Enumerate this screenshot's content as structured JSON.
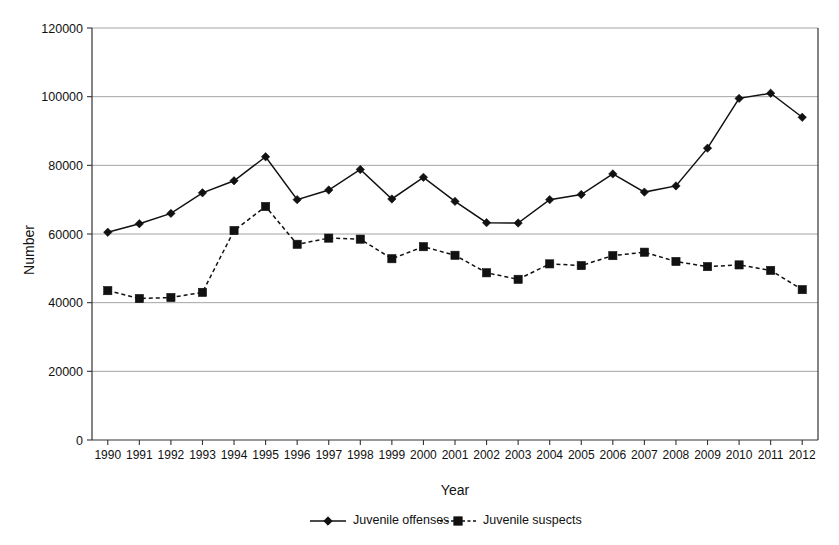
{
  "chart_data": {
    "type": "line",
    "title": "",
    "xlabel": "Year",
    "ylabel": "Number",
    "ylim": [
      0,
      120000
    ],
    "ytick_labels": [
      "0",
      "20000",
      "40000",
      "60000",
      "80000",
      "100000",
      "120000"
    ],
    "yticks": [
      0,
      20000,
      40000,
      60000,
      80000,
      100000,
      120000
    ],
    "grid": "horizontal",
    "legend_position": "bottom",
    "categories": [
      "1990",
      "1991",
      "1992",
      "1993",
      "1994",
      "1995",
      "1996",
      "1997",
      "1998",
      "1999",
      "2000",
      "2001",
      "2002",
      "2003",
      "2004",
      "2005",
      "2006",
      "2007",
      "2008",
      "2009",
      "2010",
      "2011",
      "2012"
    ],
    "x": [
      1990,
      1991,
      1992,
      1993,
      1994,
      1995,
      1996,
      1997,
      1998,
      1999,
      2000,
      2001,
      2002,
      2003,
      2004,
      2005,
      2006,
      2007,
      2008,
      2009,
      2010,
      2011,
      2012
    ],
    "series": [
      {
        "name": "Juvenile offenses",
        "marker": "diamond",
        "linestyle": "solid",
        "color": "#111111",
        "values": [
          60500,
          63000,
          66000,
          72000,
          75500,
          82500,
          70000,
          72800,
          78800,
          70200,
          76500,
          69500,
          63300,
          63200,
          70000,
          71500,
          77500,
          72200,
          74000,
          85000,
          99500,
          101000,
          94000
        ]
      },
      {
        "name": "Juvenile suspects",
        "marker": "square",
        "linestyle": "dashed",
        "color": "#111111",
        "values": [
          43500,
          41200,
          41500,
          43000,
          61000,
          68000,
          57000,
          58800,
          58500,
          52800,
          56300,
          53800,
          48700,
          46800,
          51300,
          50800,
          53700,
          54700,
          52000,
          50500,
          51000,
          49400,
          43800
        ]
      }
    ]
  },
  "legend": {
    "items": [
      {
        "label": "Juvenile offenses",
        "marker": "diamond",
        "linestyle": "solid"
      },
      {
        "label": "Juvenile suspects",
        "marker": "square",
        "linestyle": "dashed"
      }
    ]
  },
  "axes": {
    "y_title": "Number",
    "x_title": "Year"
  }
}
